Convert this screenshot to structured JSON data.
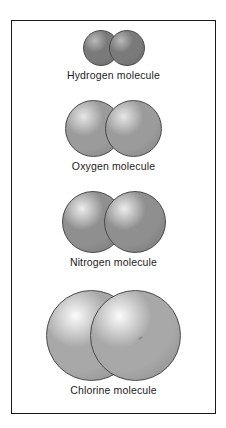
{
  "figure": {
    "frame": {
      "border_color": "#1a1a1a",
      "background": "#ffffff"
    },
    "background": "#ffffff",
    "label_color": "#1c1c1c",
    "molecules": [
      {
        "id": "hydrogen",
        "label": "Hydrogen molecule",
        "atom_count": 2,
        "atom_diameter_px": 36,
        "molecule_width_px": 62,
        "sphere_color": "#7a7a7a",
        "sphere_highlight": "#b9b9b9",
        "sphere_edge": "#4a4a4a",
        "label_font_size_px": 10.5
      },
      {
        "id": "oxygen",
        "label": "Oxygen molecule",
        "atom_count": 2,
        "atom_diameter_px": 57,
        "molecule_width_px": 97,
        "sphere_color": "#9b9b9b",
        "sphere_highlight": "#e6e6e6",
        "sphere_edge": "#4a4a4a",
        "label_font_size_px": 10.5
      },
      {
        "id": "nitrogen",
        "label": "Nitrogen molecule",
        "atom_count": 2,
        "atom_diameter_px": 62,
        "molecule_width_px": 104,
        "sphere_color": "#8f8f8f",
        "sphere_highlight": "#ededed",
        "sphere_edge": "#4a4a4a",
        "label_font_size_px": 10.5
      },
      {
        "id": "chlorine",
        "label": "Chlorine molecule",
        "atom_count": 2,
        "atom_diameter_px": 91,
        "molecule_width_px": 135,
        "sphere_color": "#a8a8a8",
        "sphere_highlight": "#fbfbfb",
        "sphere_edge": "#4a4a4a",
        "label_font_size_px": 10.5
      }
    ]
  }
}
